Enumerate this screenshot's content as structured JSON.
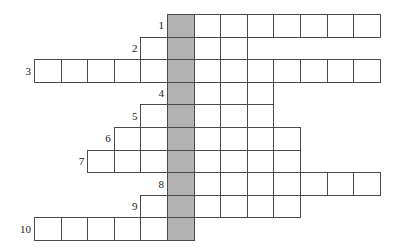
{
  "puzzle": {
    "type": "crossword-skeleton",
    "title": "",
    "cell_size": 26.6,
    "row_height": 22.6,
    "grid_origin_x": 34,
    "grid_origin_y": 14,
    "highlight_color": "#b3b3b3",
    "line_color": "#4a4a4a",
    "background_color": "#ffffff",
    "highlight_column_index": 5,
    "rows": [
      {
        "number": "1",
        "start_col": 5,
        "length": 8,
        "shaded_index": 0
      },
      {
        "number": "2",
        "start_col": 4,
        "length": 4,
        "shaded_index": 1
      },
      {
        "number": "3",
        "start_col": 0,
        "length": 13,
        "shaded_index": 5
      },
      {
        "number": "4",
        "start_col": 5,
        "length": 4,
        "shaded_index": 0
      },
      {
        "number": "5",
        "start_col": 4,
        "length": 5,
        "shaded_index": 1
      },
      {
        "number": "6",
        "start_col": 3,
        "length": 7,
        "shaded_index": 2
      },
      {
        "number": "7",
        "start_col": 2,
        "length": 8,
        "shaded_index": 3
      },
      {
        "number": "8",
        "start_col": 5,
        "length": 8,
        "shaded_index": 0
      },
      {
        "number": "9",
        "start_col": 4,
        "length": 6,
        "shaded_index": 1
      },
      {
        "number": "10",
        "start_col": 0,
        "length": 6,
        "shaded_index": 5
      }
    ]
  }
}
